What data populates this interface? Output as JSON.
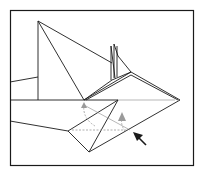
{
  "diagram": {
    "type": "origami-fold-step",
    "colors": {
      "line": "#1a1a1a",
      "fold_line": "#888888",
      "arrow_gray": "#9a9a9a",
      "background": "#ffffff"
    },
    "symbols": [
      "valley-fold-dashed-line",
      "fold-arrow",
      "push-arrow"
    ]
  }
}
